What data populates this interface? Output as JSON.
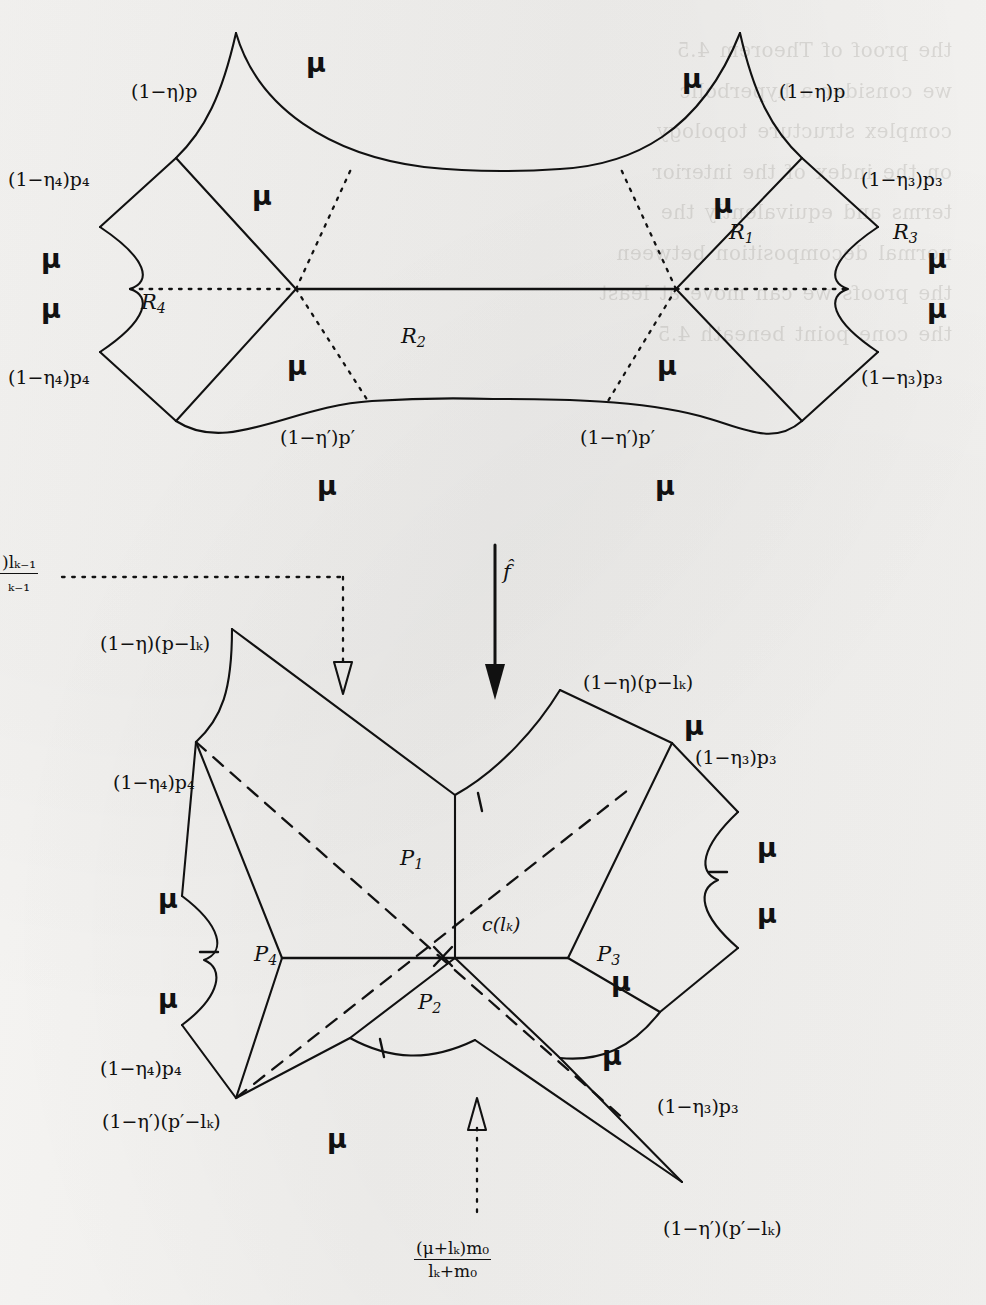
{
  "figure": {
    "kind": "hyperbolic-surface-decomposition",
    "map_label": "f̂",
    "top": {
      "regions": [
        {
          "name": "R1",
          "base": "R",
          "sub": "1"
        },
        {
          "name": "R2",
          "base": "R",
          "sub": "2"
        },
        {
          "name": "R3",
          "base": "R",
          "sub": "3"
        },
        {
          "name": "R4",
          "base": "R",
          "sub": "4"
        }
      ],
      "edge_labels": [
        {
          "id": "top-left-p",
          "text": "(1−η)p"
        },
        {
          "id": "top-right-p",
          "text": "(1−η)p"
        },
        {
          "id": "upper-left-p4",
          "text": "(1−η₄)p₄"
        },
        {
          "id": "lower-left-p4",
          "text": "(1−η₄)p₄"
        },
        {
          "id": "upper-right-p3",
          "text": "(1−η₃)p₃"
        },
        {
          "id": "lower-right-p3",
          "text": "(1−η₃)p₃"
        },
        {
          "id": "bottom-left-pp",
          "text": "(1−η′)p′"
        },
        {
          "id": "bottom-right-pp",
          "text": "(1−η′)p′"
        }
      ],
      "mu_labels": [
        "μ",
        "μ",
        "μ",
        "μ",
        "μ",
        "μ",
        "μ",
        "μ",
        "μ",
        "μ",
        "μ",
        "μ"
      ]
    },
    "bottom": {
      "regions": [
        {
          "name": "P1",
          "base": "P",
          "sub": "1"
        },
        {
          "name": "P2",
          "base": "P",
          "sub": "2"
        },
        {
          "name": "P3",
          "base": "P",
          "sub": "3"
        },
        {
          "name": "P4",
          "base": "P",
          "sub": "4"
        }
      ],
      "geodesic_label": {
        "base": "c",
        "arg": "(l",
        "argsub": "k",
        "argclose": ")",
        "text": "c(lₖ)"
      },
      "edge_labels": [
        {
          "id": "upper-left-plk",
          "text": "(1−η)(p−lₖ)"
        },
        {
          "id": "upper-right-plk",
          "text": "(1−η)(p−lₖ)"
        },
        {
          "id": "left-p4-upper",
          "text": "(1−η₄)p₄"
        },
        {
          "id": "left-p4-lower",
          "text": "(1−η₄)p₄"
        },
        {
          "id": "right-p3-upper",
          "text": "(1−η₃)p₃"
        },
        {
          "id": "right-p3-lower",
          "text": "(1−η₃)p₃"
        },
        {
          "id": "bottom-left-pplk",
          "text": "(1−η′)(p′−lₖ)"
        },
        {
          "id": "bottom-right-pplk",
          "text": "(1−η′)(p′−lₖ)"
        }
      ],
      "mu_labels": [
        "μ",
        "μ",
        "μ",
        "μ",
        "μ",
        "μ",
        "μ",
        "μ"
      ]
    },
    "callouts": {
      "left_fraction": {
        "numerator": ")lₖ₋₁",
        "denominator": "ₖ₋₁",
        "clipped": true
      },
      "bottom_fraction": {
        "numerator": "(μ+lₖ)m₀",
        "denominator": "lₖ+m₀"
      }
    }
  },
  "bleed_text": "the proof of Theorem 4.5\nwe consider a hyperbolic\ncomplex structure topology\non the index of the interior\nterms and equivalently the\nnormal decomposition between\nthe proofs we can move at least\nthe cone point beneath 4.5",
  "colors": {
    "ink": "#111111",
    "paper": "#f3f2f0",
    "bleed": "#7b7770"
  }
}
